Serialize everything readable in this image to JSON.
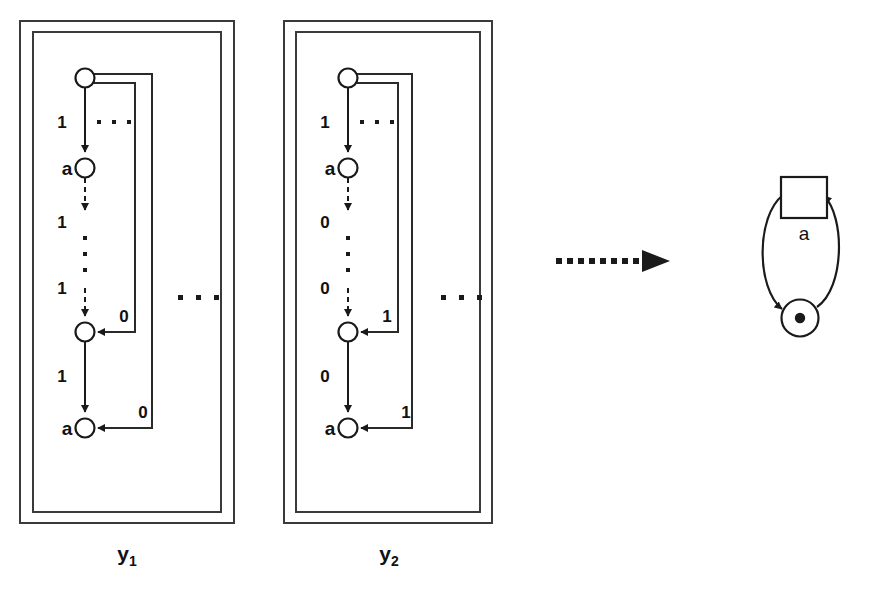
{
  "figure": {
    "background_color": "#ffffff",
    "ink_color": "#1a1a1a",
    "box_color": "#3a3a3a"
  },
  "structures": [
    {
      "id": "y1",
      "label": "y",
      "label_subscript": "1",
      "nodes": [
        {
          "id": "y1-n0",
          "name": "initial-state",
          "node_label": "",
          "cx": 85,
          "cy": 78,
          "r": 9.5
        },
        {
          "id": "y1-n1",
          "name": "accepting-state-upper",
          "node_label": "a",
          "cx": 85,
          "cy": 168,
          "r": 9.5
        },
        {
          "id": "y1-n2",
          "name": "intermediate-state",
          "node_label": "",
          "cx": 85,
          "cy": 332,
          "r": 9.5
        },
        {
          "id": "y1-n3",
          "name": "accepting-state-lower",
          "node_label": "a",
          "cx": 85,
          "cy": 428,
          "r": 9.5
        }
      ],
      "edge_labels": [
        {
          "name": "edge-label-top",
          "text": "1",
          "x": 62,
          "y": 128
        },
        {
          "name": "edge-label-second",
          "text": "1",
          "x": 62,
          "y": 228
        },
        {
          "name": "edge-label-third",
          "text": "1",
          "x": 62,
          "y": 294
        },
        {
          "name": "edge-label-fourth",
          "text": "1",
          "x": 62,
          "y": 382
        },
        {
          "name": "loop-label-inner",
          "text": "0",
          "x": 124,
          "y": 322
        },
        {
          "name": "loop-label-outer",
          "text": "0",
          "x": 143,
          "y": 418
        }
      ],
      "ellipsis_horizontal": {
        "name": "ellipsis-beside-top-edge",
        "dots": 3,
        "x": 96,
        "y": 128,
        "gap": 15
      },
      "ellipsis_vertical": {
        "name": "ellipsis-vertical",
        "dots": 3,
        "x": 85,
        "y": 252,
        "gap": 16
      },
      "ellipsis_outside": {
        "name": "ellipsis-right-of-structure",
        "dots": 3,
        "x": 180,
        "y": 297,
        "gap": 18
      }
    },
    {
      "id": "y2",
      "label": "y",
      "label_subscript": "2",
      "nodes": [
        {
          "id": "y2-n0",
          "name": "initial-state",
          "node_label": "",
          "cx": 348,
          "cy": 78,
          "r": 9.5
        },
        {
          "id": "y2-n1",
          "name": "accepting-state-upper",
          "node_label": "a",
          "cx": 348,
          "cy": 168,
          "r": 9.5
        },
        {
          "id": "y2-n2",
          "name": "intermediate-state",
          "node_label": "",
          "cx": 348,
          "cy": 332,
          "r": 9.5
        },
        {
          "id": "y2-n3",
          "name": "accepting-state-lower",
          "node_label": "a",
          "cx": 348,
          "cy": 428,
          "r": 9.5
        }
      ],
      "edge_labels": [
        {
          "name": "edge-label-top",
          "text": "1",
          "x": 325,
          "y": 128
        },
        {
          "name": "edge-label-second",
          "text": "0",
          "x": 325,
          "y": 228
        },
        {
          "name": "edge-label-third",
          "text": "0",
          "x": 325,
          "y": 294
        },
        {
          "name": "edge-label-fourth",
          "text": "0",
          "x": 325,
          "y": 382
        },
        {
          "name": "loop-label-inner",
          "text": "1",
          "x": 387,
          "y": 322
        },
        {
          "name": "loop-label-outer",
          "text": "1",
          "x": 406,
          "y": 418
        }
      ],
      "ellipsis_horizontal": {
        "name": "ellipsis-beside-top-edge",
        "dots": 3,
        "x": 359,
        "y": 128,
        "gap": 15
      },
      "ellipsis_vertical": {
        "name": "ellipsis-vertical",
        "dots": 3,
        "x": 348,
        "y": 252,
        "gap": 16
      },
      "ellipsis_outside": {
        "name": "ellipsis-right-of-structure",
        "dots": 3,
        "x": 443,
        "y": 297,
        "gap": 18
      }
    }
  ],
  "transform_arrow": {
    "name": "transformation-arrow",
    "style": "dotted-with-solid-head",
    "dot_count": 11,
    "x_start": 556,
    "y": 261,
    "dot_size": 6,
    "dot_gap": 11,
    "head_x": 668
  },
  "petri_net": {
    "name": "result-petri-net",
    "transition": {
      "name": "transition-square",
      "x": 781,
      "y": 177,
      "width": 46,
      "height": 41
    },
    "transition_label": {
      "name": "transition-label-a",
      "text": "a",
      "x": 804,
      "y": 239
    },
    "place": {
      "name": "place-circle",
      "cx": 800,
      "cy": 318,
      "r": 18.5
    },
    "token": {
      "name": "place-token",
      "cx": 800,
      "cy": 318,
      "r": 5.2,
      "count": 1
    },
    "arcs": [
      {
        "name": "arc-transition-to-place",
        "direction": "left-side-downward"
      },
      {
        "name": "arc-place-to-transition",
        "direction": "right-side-upward"
      }
    ]
  }
}
